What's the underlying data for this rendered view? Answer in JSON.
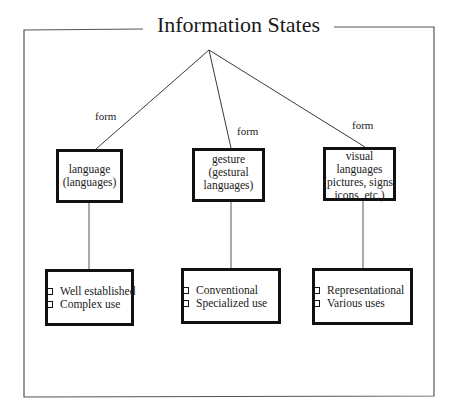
{
  "title": "Information States",
  "edge_label": "form",
  "edges": [
    {
      "label": "form"
    },
    {
      "label": "form"
    },
    {
      "label": "form"
    }
  ],
  "categories": [
    {
      "name_lines": [
        "language",
        "(languages)"
      ],
      "properties": [
        "Well established",
        "Complex use"
      ]
    },
    {
      "name_lines": [
        "gesture",
        "(gestural",
        "languages)"
      ],
      "properties": [
        "Conventional",
        "Specialized use"
      ]
    },
    {
      "name_lines": [
        "visual",
        "languages",
        "(pictures, signs,",
        "icons, etc.)"
      ],
      "properties": [
        "Representational",
        "Various uses"
      ]
    }
  ],
  "colors": {
    "stroke": "#111111",
    "frame": "#555555",
    "background": "#ffffff"
  }
}
